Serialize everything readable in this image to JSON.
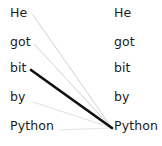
{
  "diagram": {
    "type": "attention-weight-visualization",
    "width": 162,
    "height": 146,
    "background_color": "#ffffff",
    "text_color": "#1b1b1b"
  },
  "source_column": {
    "name": "source-tokens",
    "x": 10,
    "tokens": [
      {
        "label": "He",
        "y": 16
      },
      {
        "label": "got",
        "y": 45
      },
      {
        "label": "bit",
        "y": 71
      },
      {
        "label": "by",
        "y": 100
      },
      {
        "label": "Python",
        "y": 129
      }
    ]
  },
  "target_column": {
    "name": "target-tokens",
    "x": 114,
    "tokens": [
      {
        "label": "He",
        "y": 16
      },
      {
        "label": "got",
        "y": 45
      },
      {
        "label": "bit",
        "y": 71
      },
      {
        "label": "by",
        "y": 100
      },
      {
        "label": "Python",
        "y": 129
      }
    ]
  },
  "attention_edges": {
    "converge_point": {
      "x": 112,
      "y": 128
    },
    "edges": [
      {
        "from": "He",
        "to": "Python",
        "x1": 33,
        "y1": 15,
        "weight": 0.16,
        "stroke": "#c9c9c9",
        "stroke_width": 0.9
      },
      {
        "from": "got",
        "to": "Python",
        "x1": 34,
        "y1": 44,
        "weight": 0.16,
        "stroke": "#c9c9c9",
        "stroke_width": 0.9
      },
      {
        "from": "bit",
        "to": "Python",
        "x1": 31,
        "y1": 70,
        "weight": 1.0,
        "stroke": "#111111",
        "stroke_width": 2.7
      },
      {
        "from": "by",
        "to": "Python",
        "x1": 33,
        "y1": 102,
        "weight": 0.1,
        "stroke": "#d8d8d8",
        "stroke_width": 0.8
      },
      {
        "from": "Python",
        "to": "Python",
        "x1": 59,
        "y1": 130,
        "weight": 0.08,
        "stroke": "#dddddd",
        "stroke_width": 0.8
      }
    ]
  }
}
